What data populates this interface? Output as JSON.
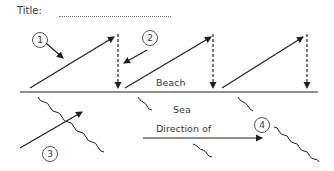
{
  "header": {
    "title_label": "Title:"
  },
  "labels": {
    "beach": "Beach",
    "sea": "Sea",
    "direction": "Direction of"
  },
  "markers": [
    {
      "id": "1",
      "label": "1"
    },
    {
      "id": "2",
      "label": "2"
    },
    {
      "id": "3",
      "label": "3"
    },
    {
      "id": "4",
      "label": "4"
    }
  ],
  "colors": {
    "line": "#231f20",
    "text": "#3a3a3a"
  }
}
